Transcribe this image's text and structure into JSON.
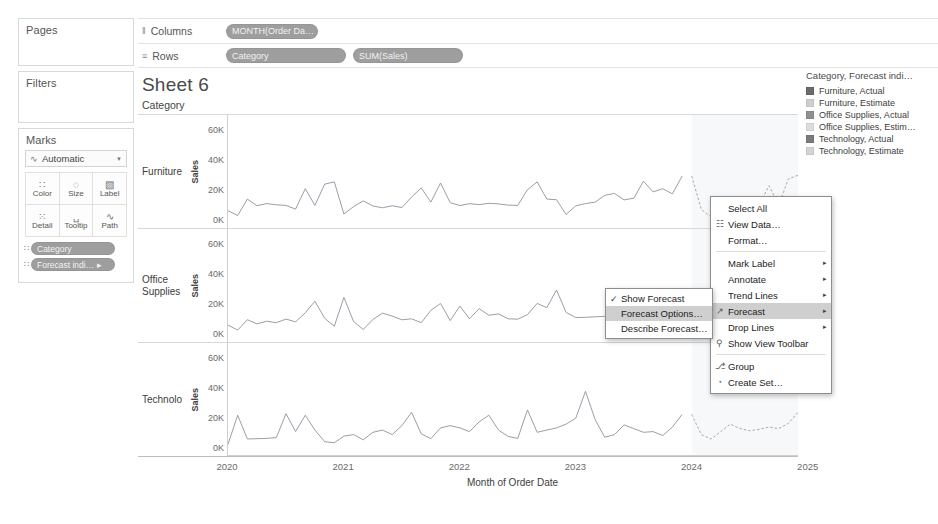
{
  "app": {
    "sheet_title": "Sheet 6"
  },
  "cards": {
    "pages": {
      "title": "Pages"
    },
    "filters": {
      "title": "Filters"
    },
    "marks": {
      "title": "Marks",
      "mark_type": "Automatic",
      "mark_type_icon": "line-mark-icon",
      "caret": "▼",
      "buttons": [
        {
          "name": "color",
          "label": "Color",
          "glyph": "∷"
        },
        {
          "name": "size",
          "label": "Size",
          "glyph": "◌"
        },
        {
          "name": "label",
          "label": "Label",
          "glyph": "▧"
        },
        {
          "name": "detail",
          "label": "Detail",
          "glyph": "⁙"
        },
        {
          "name": "tooltip",
          "label": "Tooltip",
          "glyph": "␣"
        },
        {
          "name": "path",
          "label": "Path",
          "glyph": "∿"
        }
      ],
      "pills": [
        {
          "name": "category",
          "label": "Category",
          "icon": "∷"
        },
        {
          "name": "forecast-indicator",
          "label": "Forecast indi… ▸",
          "icon": "∷"
        }
      ]
    }
  },
  "shelves": {
    "columns": {
      "label": "Columns",
      "icon": "‖",
      "pills": [
        {
          "name": "month-order-date",
          "label": "MONTH(Order Da…"
        }
      ]
    },
    "rows": {
      "label": "Rows",
      "icon": "≡",
      "pills": [
        {
          "name": "category",
          "label": "Category"
        },
        {
          "name": "sum-sales",
          "label": "SUM(Sales)"
        }
      ]
    }
  },
  "viz": {
    "column_header": "Category",
    "y_axis_title": "Sales",
    "y_ticks": [
      "60K",
      "40K",
      "20K",
      "0K"
    ],
    "x_axis_title": "Month of Order Date",
    "x_ticks": [
      "2020",
      "2021",
      "2022",
      "2023",
      "2024",
      "2025"
    ],
    "row_labels": [
      "Furniture",
      "Office Supplies",
      "Technolo"
    ]
  },
  "legend": {
    "title": "Category, Forecast indi…",
    "items": [
      {
        "label": "Furniture, Actual",
        "color": "#6a6a6a"
      },
      {
        "label": "Furniture, Estimate",
        "color": "#cfcfcf"
      },
      {
        "label": "Office Supplies, Actual",
        "color": "#8f8f8f"
      },
      {
        "label": "Office Supplies, Estim…",
        "color": "#dddddd"
      },
      {
        "label": "Technology, Actual",
        "color": "#7a7a7a"
      },
      {
        "label": "Technology, Estimate",
        "color": "#d4d4d4"
      }
    ]
  },
  "context_menu": {
    "items": [
      {
        "name": "select-all",
        "label": "Select All",
        "icon": "",
        "icon_name": "none",
        "arrow": false,
        "selected": false,
        "separator_after": false
      },
      {
        "name": "view-data",
        "label": "View Data…",
        "icon": "☷",
        "icon_name": "table-icon",
        "arrow": false,
        "selected": false,
        "separator_after": false
      },
      {
        "name": "format",
        "label": "Format…",
        "icon": "",
        "icon_name": "none",
        "arrow": false,
        "selected": false,
        "separator_after": true
      },
      {
        "name": "mark-label",
        "label": "Mark Label",
        "icon": "",
        "icon_name": "none",
        "arrow": true,
        "selected": false,
        "separator_after": false
      },
      {
        "name": "annotate",
        "label": "Annotate",
        "icon": "",
        "icon_name": "none",
        "arrow": true,
        "selected": false,
        "separator_after": false
      },
      {
        "name": "trend-lines",
        "label": "Trend Lines",
        "icon": "",
        "icon_name": "none",
        "arrow": true,
        "selected": false,
        "separator_after": false
      },
      {
        "name": "forecast",
        "label": "Forecast",
        "icon": "↗",
        "icon_name": "forecast-icon",
        "arrow": true,
        "selected": true,
        "separator_after": false
      },
      {
        "name": "drop-lines",
        "label": "Drop Lines",
        "icon": "",
        "icon_name": "none",
        "arrow": true,
        "selected": false,
        "separator_after": false
      },
      {
        "name": "show-view-toolbar",
        "label": "Show View Toolbar",
        "icon": "⚲",
        "icon_name": "magnifier-icon",
        "arrow": false,
        "selected": false,
        "separator_after": true
      },
      {
        "name": "group",
        "label": "Group",
        "icon": "⎇",
        "icon_name": "paperclip-icon",
        "arrow": false,
        "selected": false,
        "separator_after": false
      },
      {
        "name": "create-set",
        "label": "Create Set…",
        "icon": "◔",
        "icon_name": "set-icon",
        "arrow": false,
        "selected": false,
        "separator_after": false
      }
    ]
  },
  "forecast_submenu": {
    "items": [
      {
        "name": "show-forecast",
        "label": "Show Forecast",
        "checked": true,
        "selected": false
      },
      {
        "name": "forecast-options",
        "label": "Forecast Options…",
        "checked": false,
        "selected": true
      },
      {
        "name": "describe-forecast",
        "label": "Describe Forecast…",
        "checked": false,
        "selected": false
      }
    ]
  },
  "chart_data": {
    "type": "line",
    "title": "Sheet 6",
    "xlabel": "Month of Order Date",
    "ylabel": "Sales",
    "ylim": [
      0,
      65000
    ],
    "yticks": [
      0,
      20000,
      40000,
      60000
    ],
    "xlim": [
      "2020-01",
      "2025-01"
    ],
    "xticks": [
      "2020",
      "2021",
      "2022",
      "2023",
      "2024",
      "2025"
    ],
    "grid": false,
    "legend_position": "right",
    "forecast_start": "2024-01",
    "panes": [
      {
        "category": "Furniture",
        "series": [
          {
            "name": "Furniture, Actual",
            "kind": "actual",
            "values": [
              6200,
              3000,
              14000,
              9600,
              11000,
              10200,
              9800,
              7300,
              21000,
              9800,
              24000,
              25500,
              4000,
              9000,
              12800,
              9400,
              8200,
              9600,
              8300,
              15400,
              21500,
              12000,
              24800,
              11600,
              9700,
              10900,
              10300,
              11200,
              10800,
              10000,
              9800,
              20300,
              25600,
              14000,
              13600,
              3700,
              9500,
              11000,
              12000,
              16500,
              17800,
              13500,
              14600,
              26000,
              18800,
              21000,
              17500,
              29500
            ]
          },
          {
            "name": "Furniture, Estimate",
            "kind": "estimate",
            "values": [
              29500,
              7000,
              2000,
              9600,
              11200,
              11500,
              12000,
              10600,
              23000,
              9800,
              27500,
              30000
            ]
          }
        ]
      },
      {
        "category": "Office Supplies",
        "series": [
          {
            "name": "Office Supplies, Actual",
            "kind": "actual",
            "values": [
              6000,
              2600,
              9600,
              6800,
              8600,
              7600,
              10000,
              8200,
              14200,
              22000,
              10500,
              5200,
              24500,
              8400,
              3000,
              9800,
              14000,
              12000,
              9500,
              10200,
              7600,
              15800,
              20500,
              9000,
              18700,
              10200,
              17000,
              12500,
              13500,
              10200,
              9900,
              13000,
              20500,
              17600,
              29500,
              14500,
              11000,
              11200,
              11500,
              11800,
              11600,
              11400,
              11200,
              11500,
              11800,
              12000,
              11500,
              11700
            ]
          },
          {
            "name": "Office Supplies, Estimate",
            "kind": "estimate",
            "values": [
              11700,
              9000,
              7500,
              10500,
              14500,
              12500,
              11000,
              12000,
              14800,
              18500,
              24500,
              15500
            ]
          }
        ]
      },
      {
        "category": "Technology",
        "series": [
          {
            "name": "Technology, Actual",
            "kind": "actual",
            "values": [
              2500,
              22000,
              6000,
              6200,
              6400,
              7000,
              23000,
              11000,
              22000,
              12000,
              4200,
              3500,
              8000,
              9000,
              5500,
              10500,
              12000,
              9000,
              15000,
              24000,
              9500,
              6200,
              13500,
              15000,
              13500,
              11000,
              17500,
              22000,
              12000,
              7800,
              6400,
              25500,
              10500,
              12000,
              13500,
              16000,
              20000,
              38000,
              19000,
              7200,
              9000,
              15500,
              13000,
              10500,
              11000,
              8400,
              14000,
              22500
            ]
          },
          {
            "name": "Technology, Estimate",
            "kind": "estimate",
            "values": [
              22500,
              9000,
              6000,
              11000,
              16000,
              13000,
              11500,
              12500,
              14000,
              13000,
              16500,
              24000
            ]
          }
        ]
      }
    ]
  }
}
